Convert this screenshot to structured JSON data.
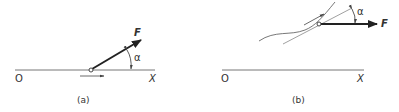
{
  "panel_a": {
    "caption": "(a)",
    "origin_label": "O",
    "axis_label": "X",
    "force_label": "F",
    "angle_label": "α"
  },
  "panel_b": {
    "caption": "(b)",
    "origin_label": "O",
    "axis_label": "X",
    "force_label": "F",
    "angle_label": "α"
  },
  "colors": {
    "line": "#555555",
    "force": "#222222",
    "background": "#ffffff"
  }
}
